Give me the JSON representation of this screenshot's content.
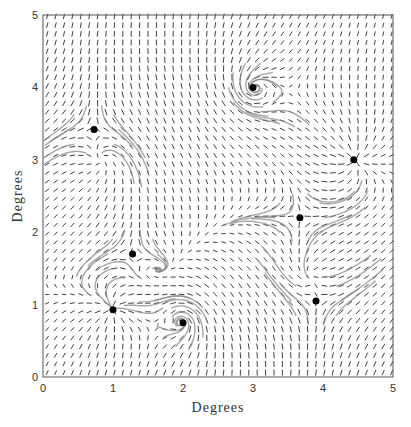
{
  "chart_data": {
    "type": "vector_field",
    "title": "",
    "xlabel": "Degrees",
    "ylabel": "Degrees",
    "xlim": [
      0,
      5
    ],
    "ylim": [
      0,
      5
    ],
    "xticks": [
      0,
      1,
      2,
      3,
      4,
      5
    ],
    "yticks": [
      0,
      1,
      2,
      3,
      4,
      5
    ],
    "grid": false,
    "critical_points": [
      {
        "x": 0.73,
        "y": 3.42,
        "type": "saddle"
      },
      {
        "x": 3.0,
        "y": 4.0,
        "type": "spiral"
      },
      {
        "x": 4.44,
        "y": 3.0,
        "type": "node"
      },
      {
        "x": 3.67,
        "y": 2.2,
        "type": "saddle"
      },
      {
        "x": 1.28,
        "y": 1.7,
        "type": "saddle"
      },
      {
        "x": 1.0,
        "y": 0.93,
        "type": "node"
      },
      {
        "x": 2.0,
        "y": 0.75,
        "type": "spiral"
      },
      {
        "x": 3.9,
        "y": 1.05,
        "type": "saddle"
      }
    ],
    "colors": {
      "arrows": "#2a2a2a",
      "streamlines_gray": "#8a8a8a",
      "points": "#000000",
      "frame": "#555555"
    }
  }
}
